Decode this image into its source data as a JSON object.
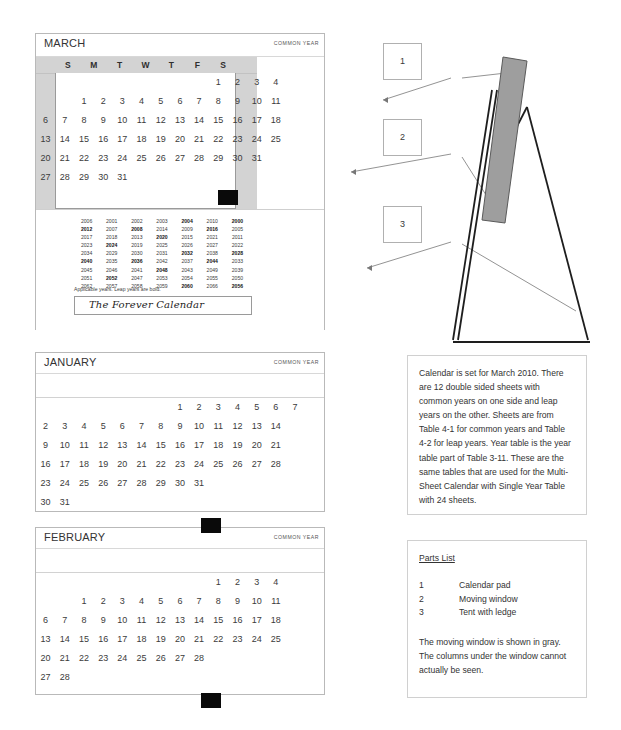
{
  "months": {
    "march": {
      "name": "MARCH",
      "year_label": "COMMON YEAR",
      "dow": [
        "S",
        "M",
        "T",
        "W",
        "T",
        "F",
        "S"
      ],
      "rows": [
        [
          "",
          "",
          "",
          "",
          "",
          "",
          "",
          "",
          "",
          "1",
          "2",
          "3",
          "4"
        ],
        [
          "",
          "",
          "1",
          "2",
          "3",
          "4",
          "5",
          "6",
          "7",
          "8",
          "9",
          "10",
          "11"
        ],
        [
          "6",
          "7",
          "8",
          "9",
          "10",
          "11",
          "12",
          "13",
          "14",
          "15",
          "16",
          "17",
          "18"
        ],
        [
          "13",
          "14",
          "15",
          "16",
          "17",
          "18",
          "19",
          "20",
          "21",
          "22",
          "23",
          "24",
          "25"
        ],
        [
          "20",
          "21",
          "22",
          "23",
          "24",
          "25",
          "26",
          "27",
          "28",
          "29",
          "30",
          "31",
          ""
        ],
        [
          "27",
          "28",
          "29",
          "30",
          "31",
          "",
          "",
          "",
          "",
          "",
          "",
          "",
          ""
        ]
      ]
    },
    "january": {
      "name": "JANUARY",
      "year_label": "COMMON YEAR",
      "rows": [
        [
          "",
          "",
          "",
          "",
          "",
          "",
          "",
          "1",
          "2",
          "3",
          "4",
          "5",
          "6",
          "7"
        ],
        [
          "2",
          "3",
          "4",
          "5",
          "6",
          "7",
          "8",
          "9",
          "10",
          "11",
          "12",
          "13",
          "14"
        ],
        [
          "9",
          "10",
          "11",
          "12",
          "13",
          "14",
          "15",
          "16",
          "17",
          "18",
          "19",
          "20",
          "21"
        ],
        [
          "16",
          "17",
          "18",
          "19",
          "20",
          "21",
          "22",
          "23",
          "24",
          "25",
          "26",
          "27",
          "28"
        ],
        [
          "23",
          "24",
          "25",
          "26",
          "27",
          "28",
          "29",
          "30",
          "31",
          "",
          "",
          "",
          ""
        ],
        [
          "30",
          "31",
          "",
          "",
          "",
          "",
          "",
          "",
          "",
          "",
          "",
          "",
          ""
        ]
      ]
    },
    "february": {
      "name": "FEBRUARY",
      "year_label": "COMMON YEAR",
      "rows": [
        [
          "",
          "",
          "",
          "",
          "",
          "",
          "",
          "",
          "",
          "1",
          "2",
          "3",
          "4"
        ],
        [
          "",
          "",
          "1",
          "2",
          "3",
          "4",
          "5",
          "6",
          "7",
          "8",
          "9",
          "10",
          "11"
        ],
        [
          "6",
          "7",
          "8",
          "9",
          "10",
          "11",
          "12",
          "13",
          "14",
          "15",
          "16",
          "17",
          "18"
        ],
        [
          "13",
          "14",
          "15",
          "16",
          "17",
          "18",
          "19",
          "20",
          "21",
          "22",
          "23",
          "24",
          "25"
        ],
        [
          "20",
          "21",
          "22",
          "23",
          "24",
          "25",
          "26",
          "27",
          "28",
          "",
          "",
          "",
          ""
        ],
        [
          "27",
          "28",
          "",
          "",
          "",
          "",
          "",
          "",
          "",
          "",
          "",
          "",
          ""
        ]
      ]
    }
  },
  "year_table": {
    "rows": [
      [
        {
          "y": "2006",
          "bold": false
        },
        {
          "y": "2001",
          "bold": false
        },
        {
          "y": "2002",
          "bold": false
        },
        {
          "y": "2003",
          "bold": false
        },
        {
          "y": "2004",
          "bold": true
        },
        {
          "y": "2010",
          "bold": false
        },
        {
          "y": "2000",
          "bold": true
        }
      ],
      [
        {
          "y": "2012",
          "bold": true
        },
        {
          "y": "2007",
          "bold": false
        },
        {
          "y": "2008",
          "bold": true
        },
        {
          "y": "2014",
          "bold": false
        },
        {
          "y": "2009",
          "bold": false
        },
        {
          "y": "2016",
          "bold": true
        },
        {
          "y": "2005",
          "bold": false
        }
      ],
      [
        {
          "y": "2017",
          "bold": false
        },
        {
          "y": "2018",
          "bold": false
        },
        {
          "y": "2013",
          "bold": false
        },
        {
          "y": "2020",
          "bold": true
        },
        {
          "y": "2015",
          "bold": false
        },
        {
          "y": "2021",
          "bold": false
        },
        {
          "y": "2011",
          "bold": false
        }
      ],
      [
        {
          "y": "2023",
          "bold": false
        },
        {
          "y": "2024",
          "bold": true
        },
        {
          "y": "2019",
          "bold": false
        },
        {
          "y": "2025",
          "bold": false
        },
        {
          "y": "2026",
          "bold": false
        },
        {
          "y": "2027",
          "bold": false
        },
        {
          "y": "2022",
          "bold": false
        }
      ],
      [
        {
          "y": "2034",
          "bold": false
        },
        {
          "y": "2029",
          "bold": false
        },
        {
          "y": "2030",
          "bold": false
        },
        {
          "y": "2031",
          "bold": false
        },
        {
          "y": "2032",
          "bold": true
        },
        {
          "y": "2038",
          "bold": false
        },
        {
          "y": "2028",
          "bold": true
        }
      ],
      [
        {
          "y": "2040",
          "bold": true
        },
        {
          "y": "2035",
          "bold": false
        },
        {
          "y": "2036",
          "bold": true
        },
        {
          "y": "2042",
          "bold": false
        },
        {
          "y": "2037",
          "bold": false
        },
        {
          "y": "2044",
          "bold": true
        },
        {
          "y": "2033",
          "bold": false
        }
      ],
      [
        {
          "y": "2045",
          "bold": false
        },
        {
          "y": "2046",
          "bold": false
        },
        {
          "y": "2041",
          "bold": false
        },
        {
          "y": "2048",
          "bold": true
        },
        {
          "y": "2043",
          "bold": false
        },
        {
          "y": "2049",
          "bold": false
        },
        {
          "y": "2039",
          "bold": false
        }
      ],
      [
        {
          "y": "2051",
          "bold": false
        },
        {
          "y": "2052",
          "bold": true
        },
        {
          "y": "2047",
          "bold": false
        },
        {
          "y": "2053",
          "bold": false
        },
        {
          "y": "2054",
          "bold": false
        },
        {
          "y": "2055",
          "bold": false
        },
        {
          "y": "2050",
          "bold": false
        }
      ],
      [
        {
          "y": "2062",
          "bold": false
        },
        {
          "y": "2057",
          "bold": false
        },
        {
          "y": "2058",
          "bold": false
        },
        {
          "y": "2059",
          "bold": false
        },
        {
          "y": "2060",
          "bold": true
        },
        {
          "y": "2066",
          "bold": false
        },
        {
          "y": "2056",
          "bold": true
        }
      ]
    ],
    "note": "Applicable years.  Leap years are bold.",
    "brand": "The Forever Calendar"
  },
  "description": {
    "text": "Calendar is set for March 2010. There are 12 double sided sheets with common years on one side and leap years on the other. Sheets are from Table 4-1 for common years and Table 4-2 for leap years. Year table is the year table part of Table 3-11. These are the same tables that are used for the Multi-Sheet Calendar with Single Year Table with 24 sheets."
  },
  "parts_list": {
    "title": "Parts List",
    "items": [
      {
        "num": "1",
        "label": "Calendar pad"
      },
      {
        "num": "2",
        "label": "Moving window"
      },
      {
        "num": "3",
        "label": "Tent with ledge"
      }
    ],
    "footer": "The moving window is shown in gray. The columns under the window cannot actually be seen."
  },
  "callouts": [
    {
      "num": "1"
    },
    {
      "num": "2"
    },
    {
      "num": "3"
    }
  ],
  "colors": {
    "window_gray": "#d3d3d3",
    "black_box": "#0a0a0a",
    "border": "#b9b9b9",
    "shaded_pad": "#a8a8a8"
  }
}
